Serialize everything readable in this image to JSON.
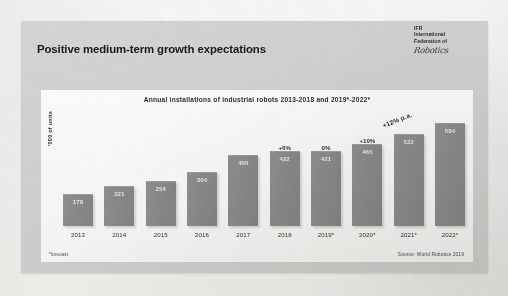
{
  "slide": {
    "title": "Positive medium-term growth expectations",
    "logo": {
      "line1": "IFR",
      "line2": "International",
      "line3": "Federation of",
      "line4": "Robotics"
    },
    "footnote": "*forecast",
    "source": "Source: World Robotics 2019"
  },
  "chart_data": {
    "type": "bar",
    "title": "Annual installations of industrial robots 2013-2018 and 2019*-2022*",
    "xlabel": "",
    "ylabel": "'000 of units",
    "ylim": [
      0,
      640
    ],
    "grid": false,
    "legend": null,
    "categories": [
      "2013",
      "2014",
      "2015",
      "2016",
      "2017",
      "2018",
      "2019*",
      "2020*",
      "2021*",
      "2022*"
    ],
    "values": [
      178,
      221,
      254,
      304,
      400,
      422,
      421,
      465,
      522,
      584
    ],
    "value_labels": [
      "178",
      "221",
      "254",
      "304",
      "400",
      "422",
      "421",
      "465",
      "522",
      "584"
    ],
    "growth_labels": [
      "",
      "",
      "",
      "",
      "",
      "+6%",
      "0%",
      "+10%",
      "",
      ""
    ],
    "annotations": [
      {
        "text": "+12% p.a.",
        "rotation": -22
      }
    ]
  },
  "bleed_text": "the influence of the 2018 market and a modest dip in the near-term reporting however the 2019 outlook remains positive with growth resuming from 2020 onwards across key regions"
}
